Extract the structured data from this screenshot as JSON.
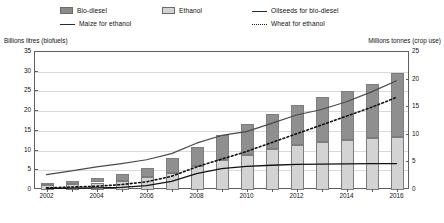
{
  "legend": {
    "items": [
      {
        "label": "Bio-diesel",
        "marker": "swatch-dark",
        "name": "legend-bio-diesel"
      },
      {
        "label": "Ethanol",
        "marker": "swatch-light",
        "name": "legend-ethanol"
      },
      {
        "label": "Oilseeds for bio-diesel",
        "marker": "line-solid",
        "name": "legend-oilseeds-for-bio-diesel"
      },
      {
        "label": "Maize for ethanol",
        "marker": "line-solid",
        "name": "legend-maize-for-ethanol"
      },
      {
        "label": "Wheat for ethanol",
        "marker": "line-dotted",
        "name": "legend-wheat-for-ethanol"
      }
    ]
  },
  "chart_data": {
    "type": "bar",
    "title": "",
    "subtitle": "",
    "xlabel": "",
    "ylabel": "Billions litres (biofuels)",
    "y2label": "Millions tonnes (crop use)",
    "ylim": [
      0,
      35
    ],
    "y2lim": [
      0,
      25
    ],
    "yticks": [
      0,
      5,
      10,
      15,
      20,
      25,
      30,
      35
    ],
    "y2ticks": [
      0,
      5,
      10,
      15,
      20,
      25
    ],
    "grid": true,
    "legend_position": "top",
    "x": [
      2002,
      2003,
      2004,
      2005,
      2006,
      2007,
      2008,
      2009,
      2010,
      2011,
      2012,
      2013,
      2014,
      2015,
      2016
    ],
    "xtick_labels": [
      "2002",
      "2004",
      "2006",
      "2008",
      "2010",
      "2012",
      "2014",
      "2016"
    ],
    "xtick_values": [
      2002,
      2004,
      2006,
      2008,
      2010,
      2012,
      2014,
      2016
    ],
    "bar_series": [
      {
        "name": "Ethanol",
        "axis": "left",
        "color": "#d3d3d3",
        "values": [
          1.2,
          1.5,
          1.9,
          2.4,
          3.2,
          4.4,
          6.0,
          7.5,
          9.0,
          10.3,
          11.4,
          12.2,
          12.8,
          13.2,
          13.5
        ]
      },
      {
        "name": "Bio-diesel",
        "axis": "left",
        "color": "#8f8f8f",
        "values": [
          0.5,
          0.8,
          1.1,
          1.6,
          2.5,
          3.6,
          5.0,
          6.5,
          7.8,
          9.0,
          10.2,
          11.3,
          12.4,
          13.8,
          16.3
        ]
      }
    ],
    "bar_totals": [
      1.7,
      2.3,
      3.0,
      4.0,
      5.7,
      8.0,
      11.0,
      14.0,
      16.8,
      19.3,
      21.6,
      23.5,
      25.2,
      27.0,
      29.8
    ],
    "line_series": [
      {
        "name": "Oilseeds for bio-diesel",
        "axis": "right",
        "style": "solid",
        "color": "#4a4a4a",
        "width": 1.2,
        "values": [
          2.6,
          3.3,
          4.0,
          4.6,
          5.3,
          6.4,
          8.3,
          9.7,
          10.4,
          11.9,
          13.4,
          14.4,
          15.8,
          17.6,
          19.6
        ]
      },
      {
        "name": "Maize for ethanol",
        "axis": "right",
        "style": "solid",
        "color": "#111111",
        "width": 1.3,
        "values": [
          0.1,
          0.15,
          0.2,
          0.3,
          0.6,
          1.4,
          2.8,
          3.7,
          4.1,
          4.3,
          4.45,
          4.5,
          4.55,
          4.6,
          4.6
        ]
      },
      {
        "name": "Wheat for ethanol",
        "axis": "right",
        "style": "dotted",
        "color": "#111111",
        "width": 1.6,
        "values": [
          0.2,
          0.35,
          0.5,
          0.8,
          1.3,
          2.3,
          4.0,
          5.4,
          6.8,
          8.4,
          10.0,
          11.6,
          13.2,
          14.8,
          16.6
        ]
      }
    ]
  }
}
